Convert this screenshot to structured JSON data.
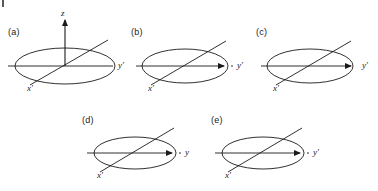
{
  "figure": {
    "title": "",
    "background_color": "#ffffff",
    "line_color": "#1a1a1a",
    "width": 378,
    "height": 191
  },
  "corner_mark": {
    "name": "page-edge-mark",
    "visible": true
  },
  "panels": [
    {
      "id": "a",
      "label": "(a)",
      "label_x": 8,
      "label_y": 27,
      "center_x": 65,
      "center_y": 66,
      "ellipse_rx": 50,
      "ellipse_ry": 18,
      "has_z_axis": true,
      "z_label": "z",
      "z_label_x": 61,
      "z_label_y": 8,
      "z_top_y": 20,
      "y_label": "y′",
      "y_label_x": 118,
      "y_label_y": 60,
      "y_axis_x1": 8,
      "y_axis_x2": 113,
      "y_arrow": false,
      "y_arrow_x": 0,
      "x_label": "x′",
      "x_label_x": 27,
      "x_label_y": 83,
      "x_axis_x1": 30,
      "x_axis_y1": 85,
      "x_axis_x2": 108,
      "x_axis_y2": 40
    },
    {
      "id": "b",
      "label": "(b)",
      "label_x": 131,
      "label_y": 27,
      "center_x": 185,
      "center_y": 66,
      "ellipse_rx": 43,
      "ellipse_ry": 17,
      "has_z_axis": false,
      "z_label": "",
      "z_label_x": 0,
      "z_label_y": 0,
      "z_top_y": 0,
      "y_label": "y′",
      "y_label_x": 237,
      "y_label_y": 60,
      "y_axis_x1": 136,
      "y_axis_x2": 233,
      "y_arrow": true,
      "y_arrow_x": 224,
      "x_label": "x′",
      "x_label_x": 148,
      "x_label_y": 83,
      "x_axis_x1": 151,
      "x_axis_y1": 85,
      "x_axis_x2": 226,
      "x_axis_y2": 41
    },
    {
      "id": "c",
      "label": "(c)",
      "label_x": 256,
      "label_y": 27,
      "center_x": 310,
      "center_y": 66,
      "ellipse_rx": 43,
      "ellipse_ry": 17,
      "has_z_axis": false,
      "z_label": "",
      "z_label_x": 0,
      "z_label_y": 0,
      "z_top_y": 0,
      "y_label": "y′",
      "y_label_x": 362,
      "y_label_y": 60,
      "y_axis_x1": 261,
      "y_axis_x2": 358,
      "y_arrow": true,
      "y_arrow_x": 351,
      "x_label": "x′",
      "x_label_x": 273,
      "x_label_y": 83,
      "x_axis_x1": 276,
      "x_axis_y1": 85,
      "x_axis_x2": 351,
      "x_axis_y2": 41
    },
    {
      "id": "d",
      "label": "(d)",
      "label_x": 82,
      "label_y": 115,
      "center_x": 135,
      "center_y": 153,
      "ellipse_rx": 41,
      "ellipse_ry": 16,
      "has_z_axis": false,
      "z_label": "",
      "z_label_x": 0,
      "z_label_y": 0,
      "z_top_y": 0,
      "y_label": "y",
      "y_label_x": 185,
      "y_label_y": 147,
      "y_axis_x1": 87,
      "y_axis_x2": 181,
      "y_arrow": true,
      "y_arrow_x": 172,
      "x_label": "x′",
      "x_label_x": 97,
      "x_label_y": 170,
      "x_axis_x1": 100,
      "x_axis_y1": 172,
      "x_axis_x2": 174,
      "x_axis_y2": 128
    },
    {
      "id": "e",
      "label": "(e)",
      "label_x": 211,
      "label_y": 115,
      "center_x": 263,
      "center_y": 153,
      "ellipse_rx": 41,
      "ellipse_ry": 16,
      "has_z_axis": false,
      "z_label": "",
      "z_label_x": 0,
      "z_label_y": 0,
      "z_top_y": 0,
      "y_label": "y′",
      "y_label_x": 313,
      "y_label_y": 147,
      "y_axis_x1": 215,
      "y_axis_x2": 309,
      "y_arrow": true,
      "y_arrow_x": 300,
      "x_label": "x′",
      "x_label_x": 225,
      "x_label_y": 170,
      "x_axis_x1": 228,
      "x_axis_y1": 172,
      "x_axis_x2": 302,
      "x_axis_y2": 128
    }
  ]
}
